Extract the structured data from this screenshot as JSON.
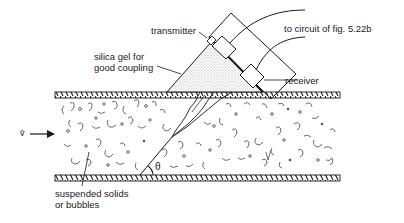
{
  "diagram": {
    "labels": {
      "transmitter": "transmitter",
      "receiver": "receiver",
      "to_circuit": "to circuit of fig. 5.22b",
      "silica_line1": "silica gel for",
      "silica_line2": "good coupling",
      "suspended_line1": "suspended solids",
      "suspended_line2": "or bubbles",
      "velocity": "v̄",
      "angle": "θ"
    },
    "colors": {
      "ink": "#1a1a1a",
      "stipple": "#bdbdbd",
      "background": "#ffffff"
    }
  }
}
